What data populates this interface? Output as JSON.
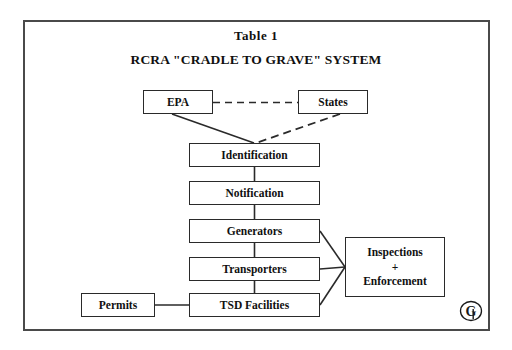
{
  "document": {
    "title": "Table 1",
    "subtitle": "RCRA \"CRADLE TO GRAVE\" SYSTEM"
  },
  "diagram": {
    "type": "flowchart",
    "nodes": [
      {
        "id": "epa",
        "label": "EPA"
      },
      {
        "id": "states",
        "label": "States"
      },
      {
        "id": "ident",
        "label": "Identification"
      },
      {
        "id": "notif",
        "label": "Notification"
      },
      {
        "id": "gen",
        "label": "Generators"
      },
      {
        "id": "trans",
        "label": "Transporters"
      },
      {
        "id": "tsd",
        "label": "TSD Facilities"
      },
      {
        "id": "permits",
        "label": "Permits"
      }
    ],
    "inspections": {
      "line1": "Inspections",
      "line2": "+",
      "line3": "Enforcement"
    },
    "edges": [
      {
        "from": "epa",
        "to": "states",
        "style": "dashed"
      },
      {
        "from": "epa",
        "to": "ident",
        "style": "solid"
      },
      {
        "from": "states",
        "to": "ident",
        "style": "dashed"
      },
      {
        "from": "ident",
        "to": "notif",
        "style": "solid"
      },
      {
        "from": "notif",
        "to": "gen",
        "style": "solid"
      },
      {
        "from": "gen",
        "to": "trans",
        "style": "solid"
      },
      {
        "from": "trans",
        "to": "tsd",
        "style": "solid"
      },
      {
        "from": "permits",
        "to": "tsd",
        "style": "solid"
      },
      {
        "from": "gen",
        "to": "inspections",
        "style": "solid"
      },
      {
        "from": "trans",
        "to": "inspections",
        "style": "solid"
      },
      {
        "from": "tsd",
        "to": "inspections",
        "style": "solid"
      }
    ]
  },
  "logo": {
    "name": "g-monogram-logo",
    "letter": "G"
  },
  "colors": {
    "border": "#4a4a4a",
    "box_border": "#2a2a2a",
    "text": "#101010",
    "background": "#ffffff"
  }
}
